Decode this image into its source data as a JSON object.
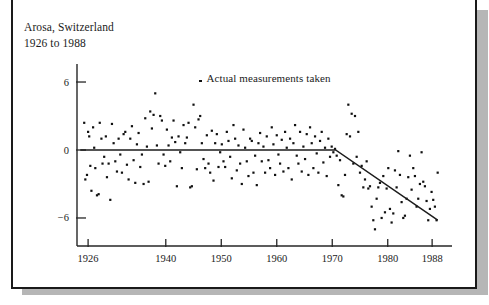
{
  "figure": {
    "caption_line1": "Arosa, Switzerland",
    "caption_line2": "1926 to 1988",
    "legend_label": "Actual measurements taken",
    "legend_marker": "point-marker-icon"
  },
  "chart_data": {
    "type": "scatter",
    "title": "Arosa, Switzerland",
    "subtitle": "1926 to 1988",
    "xlabel": "",
    "ylabel": "",
    "xlim": [
      1924,
      1990
    ],
    "ylim": [
      -9,
      7.5
    ],
    "grid": false,
    "legend_position": "inside-top-center",
    "legend": [
      "Actual measurements taken"
    ],
    "xticks": [
      1926,
      1940,
      1950,
      1960,
      1970,
      1980,
      1988
    ],
    "xtick_labels": [
      "1926",
      "1940",
      "1950",
      "1960",
      "1970",
      "1980",
      "1988"
    ],
    "yticks": [
      6,
      0,
      -6
    ],
    "ytick_labels": [
      "6",
      "0",
      "-6"
    ],
    "series": [
      {
        "name": "Actual measurements taken",
        "marker": "square",
        "x": [
          1925.3,
          1925.5,
          1925.8,
          1926.0,
          1926.2,
          1926.4,
          1926.6,
          1926.9,
          1927.1,
          1927.3,
          1927.6,
          1927.9,
          1928.1,
          1928.4,
          1928.6,
          1928.9,
          1929.2,
          1929.4,
          1929.7,
          1930.0,
          1930.3,
          1930.6,
          1930.9,
          1931.2,
          1931.5,
          1931.8,
          1932.1,
          1932.4,
          1932.7,
          1933.0,
          1933.3,
          1933.6,
          1933.9,
          1934.2,
          1934.5,
          1934.8,
          1935.1,
          1935.4,
          1935.7,
          1936.0,
          1936.3,
          1936.6,
          1936.9,
          1937.2,
          1937.5,
          1937.8,
          1938.1,
          1938.4,
          1938.7,
          1939.0,
          1939.3,
          1939.6,
          1939.9,
          1940.2,
          1940.5,
          1940.8,
          1941.1,
          1941.4,
          1941.7,
          1942.0,
          1942.3,
          1942.6,
          1942.9,
          1943.2,
          1943.5,
          1943.8,
          1944.1,
          1944.4,
          1944.7,
          1945.0,
          1945.3,
          1945.6,
          1945.9,
          1946.2,
          1946.5,
          1946.8,
          1947.1,
          1947.4,
          1947.7,
          1948.0,
          1948.3,
          1948.6,
          1948.9,
          1949.2,
          1949.5,
          1949.8,
          1950.1,
          1950.4,
          1950.7,
          1951.0,
          1951.3,
          1951.6,
          1951.9,
          1952.2,
          1952.5,
          1952.8,
          1953.1,
          1953.4,
          1953.7,
          1954.0,
          1954.3,
          1954.6,
          1954.9,
          1955.2,
          1955.5,
          1955.8,
          1956.1,
          1956.4,
          1956.7,
          1957.0,
          1957.3,
          1957.6,
          1957.9,
          1958.2,
          1958.5,
          1958.8,
          1959.1,
          1959.4,
          1959.7,
          1960.0,
          1960.3,
          1960.6,
          1960.9,
          1961.2,
          1961.5,
          1961.8,
          1962.1,
          1962.4,
          1962.7,
          1963.0,
          1963.3,
          1963.6,
          1963.9,
          1964.2,
          1964.5,
          1964.8,
          1965.1,
          1965.4,
          1965.7,
          1966.0,
          1966.3,
          1966.6,
          1966.9,
          1967.2,
          1967.5,
          1967.8,
          1968.1,
          1968.4,
          1968.7,
          1969.0,
          1969.3,
          1969.6,
          1969.9,
          1970.2,
          1970.5,
          1970.8,
          1971.1,
          1971.4,
          1971.7,
          1972.0,
          1972.3,
          1972.6,
          1972.9,
          1973.2,
          1973.5,
          1973.8,
          1974.1,
          1974.4,
          1974.7,
          1975.0,
          1975.3,
          1975.6,
          1975.9,
          1976.2,
          1976.5,
          1976.8,
          1977.1,
          1977.4,
          1977.7,
          1978.0,
          1978.3,
          1978.6,
          1978.9,
          1979.2,
          1979.5,
          1979.8,
          1980.1,
          1980.4,
          1980.7,
          1981.0,
          1981.3,
          1981.6,
          1981.9,
          1982.2,
          1982.5,
          1982.8,
          1983.1,
          1983.4,
          1983.7,
          1984.0,
          1984.3,
          1984.6,
          1984.9,
          1985.2,
          1985.5,
          1985.8,
          1986.1,
          1986.4,
          1986.7,
          1987.0,
          1987.3,
          1987.6,
          1987.9,
          1988.2,
          1988.5,
          1988.8,
          1989.0
        ],
        "y": [
          2.4,
          -2.6,
          -2.2,
          1.6,
          1.2,
          -1.4,
          -3.6,
          2.0,
          0.2,
          -1.6,
          -4.0,
          -3.9,
          2.4,
          1.0,
          -1.2,
          -0.6,
          1.2,
          -2.4,
          -1.2,
          -4.4,
          2.3,
          0.6,
          -1.0,
          -1.9,
          1.0,
          -0.4,
          -2.0,
          1.4,
          1.6,
          -1.3,
          -2.6,
          1.0,
          2.1,
          -0.9,
          -2.9,
          0.5,
          1.5,
          -1.5,
          -0.4,
          -3.0,
          2.8,
          0.3,
          -2.8,
          3.4,
          1.9,
          3.1,
          5.0,
          0.4,
          -1.2,
          3.0,
          2.6,
          -0.4,
          -1.4,
          1.8,
          0.4,
          -1.0,
          1.1,
          2.6,
          0.7,
          -3.2,
          1.2,
          -0.2,
          -1.6,
          2.2,
          0.6,
          1.1,
          2.4,
          -3.3,
          -3.2,
          4.0,
          2.0,
          -1.7,
          2.7,
          3.0,
          0.6,
          -0.8,
          -1.6,
          1.3,
          -1.2,
          -2.0,
          1.7,
          -2.7,
          0.6,
          1.4,
          -1.5,
          -0.2,
          0.5,
          -1.0,
          -1.5,
          1.6,
          0.8,
          -0.6,
          -2.5,
          2.2,
          1.0,
          -1.8,
          0.4,
          -1.2,
          -3.0,
          1.8,
          0.2,
          -1.0,
          -2.3,
          1.0,
          0.8,
          -2.0,
          -0.5,
          -3.1,
          0.6,
          1.5,
          -1.0,
          0.3,
          -2.0,
          1.2,
          -0.9,
          -1.6,
          2.0,
          0.5,
          -2.2,
          1.3,
          -0.4,
          -1.2,
          0.9,
          -1.9,
          1.6,
          0.2,
          -1.6,
          1.0,
          -2.6,
          0.6,
          2.2,
          -0.5,
          -1.2,
          1.6,
          -1.9,
          0.3,
          -0.8,
          1.4,
          -2.2,
          2.0,
          0.6,
          -1.6,
          1.2,
          -0.3,
          -2.0,
          0.8,
          1.6,
          -1.1,
          0.2,
          -2.3,
          1.0,
          -0.6,
          0.3,
          -0.2,
          0.1,
          -0.5,
          -3.1,
          -0.9,
          -4.0,
          -4.1,
          -2.2,
          1.4,
          4.0,
          1.2,
          3.2,
          -1.2,
          3.0,
          -0.6,
          1.6,
          -2.0,
          -1.4,
          -3.3,
          -2.6,
          -1.0,
          -3.4,
          -3.2,
          -5.0,
          -6.2,
          -7.0,
          -4.3,
          -3.3,
          -2.9,
          -6.0,
          -2.3,
          -5.5,
          -3.4,
          -1.6,
          -5.2,
          -6.4,
          -5.6,
          -1.8,
          -3.3,
          -0.1,
          -2.2,
          -4.6,
          -6.0,
          -5.8,
          -4.3,
          -2.4,
          -0.5,
          -3.5,
          -1.6,
          -2.3,
          -5.0,
          -4.3,
          -3.0,
          -0.2,
          -2.8,
          -3.2,
          -4.5,
          -6.2,
          -5.2,
          -3.7,
          -4.4,
          -5.0,
          -6.2,
          -2.0
        ]
      }
    ],
    "trend_line": {
      "name": "fitted trend",
      "points": [
        {
          "x": 1924.6,
          "y": 0
        },
        {
          "x": 1970.6,
          "y": 0
        },
        {
          "x": 1989.0,
          "y": -6.2
        }
      ]
    }
  }
}
